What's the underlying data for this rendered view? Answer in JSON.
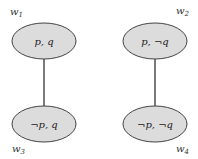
{
  "diagram": {
    "type": "kripke-model",
    "colors": {
      "node_fill": "#dcdcdc",
      "node_stroke": "#444444",
      "edge": "#333333",
      "text": "#222222"
    },
    "nodes": [
      {
        "id": "w1",
        "label_base": "w",
        "label_sub": "1",
        "content": "p, q"
      },
      {
        "id": "w2",
        "label_base": "w",
        "label_sub": "2",
        "content": "p, ¬q"
      },
      {
        "id": "w3",
        "label_base": "w",
        "label_sub": "3",
        "content": "¬p, q"
      },
      {
        "id": "w4",
        "label_base": "w",
        "label_sub": "4",
        "content": "¬p, ¬q"
      }
    ],
    "edges": [
      {
        "from": "w1",
        "to": "w3"
      },
      {
        "from": "w2",
        "to": "w4"
      }
    ]
  }
}
